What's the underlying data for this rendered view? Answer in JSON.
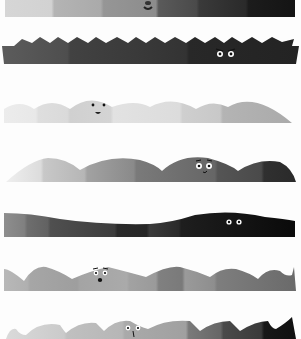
{
  "illustration": {
    "background": "#fdfdfd",
    "strips": [
      {
        "id": "strip-1",
        "shape": "flat-bar",
        "top": 0,
        "height": 18,
        "face": "smile-partial",
        "gradient": [
          "#d6d6d6",
          "#b4b4b4",
          "#969696",
          "#7a7a7a",
          "#5a5a5a",
          "#3a3a3a",
          "#1c1c1c"
        ]
      },
      {
        "id": "strip-2",
        "shape": "spiky",
        "top": 37,
        "height": 30,
        "face": "angry-eyes",
        "gradient": [
          "#5a5a5a",
          "#4c4c4c",
          "#404040",
          "#363636",
          "#2e2e2e",
          "#262626"
        ]
      },
      {
        "id": "strip-3",
        "shape": "soft-hills",
        "top": 97,
        "height": 27,
        "face": "smile",
        "gradient": [
          "#ececec",
          "#e0e0e0",
          "#d6d6d6",
          "#e2e2e2",
          "#dadada",
          "#c4c4c4",
          "#b2b2b2"
        ]
      },
      {
        "id": "strip-4",
        "shape": "big-hills",
        "top": 156,
        "height": 28,
        "face": "worried",
        "gradient": [
          "#e6e6e6",
          "#c8c8c8",
          "#a6a6a6",
          "#888888",
          "#6e6e6e",
          "#555555",
          "#3a3a3a"
        ]
      },
      {
        "id": "strip-5",
        "shape": "slope-wave",
        "top": 211,
        "height": 27,
        "face": "eyes-only",
        "gradient": [
          "#8c8c8c",
          "#6e6e6e",
          "#505050",
          "#383838",
          "#262626",
          "#161616",
          "#0c0c0c"
        ]
      },
      {
        "id": "strip-6",
        "shape": "wavy",
        "top": 265,
        "height": 28,
        "face": "surprised",
        "gradient": [
          "#bdbdbd",
          "#aaaaaa",
          "#9e9e9e",
          "#a8a8a8",
          "#8a8a8a",
          "#9a9a9a",
          "#8e8e8e",
          "#7a7a7a"
        ]
      },
      {
        "id": "strip-7",
        "shape": "fin-wave",
        "top": 317,
        "height": 22,
        "face": "curious",
        "gradient": [
          "#d8d8d8",
          "#c6c6c6",
          "#b8b8b8",
          "#a8a8a8",
          "#7a7a7a",
          "#4a4a4a",
          "#1a1a1a"
        ]
      }
    ]
  }
}
